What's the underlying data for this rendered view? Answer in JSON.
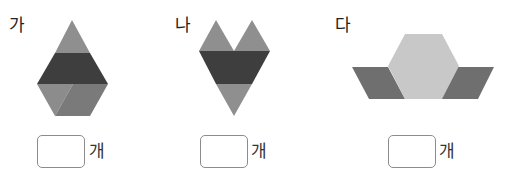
{
  "problems": [
    {
      "label": "가",
      "unit": "개",
      "answer": ""
    },
    {
      "label": "나",
      "unit": "개",
      "answer": ""
    },
    {
      "label": "다",
      "unit": "개",
      "answer": ""
    }
  ],
  "colors": {
    "triangle_green": "#8e8e8e",
    "trapezoid_red": "#3d3d3d",
    "rhombus_blue": "#7c7c7c",
    "hexagon_yellow": "#c9c9c9",
    "parallelogram": "#6e6e6e"
  }
}
